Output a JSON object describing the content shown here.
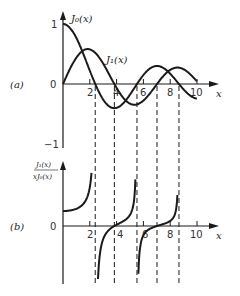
{
  "figure": {
    "panel_a": {
      "label": "(a)",
      "y_ticks": [
        "1",
        "0",
        "−1"
      ],
      "x_ticks": [
        "2",
        "4",
        "6",
        "8",
        "10"
      ],
      "x_axis_label": "x",
      "curve_labels": {
        "j0": "J₀(x)",
        "j1": "J₁(x)"
      }
    },
    "panel_b": {
      "label": "(b)",
      "y_axis_label_num": "J₁(x)",
      "y_axis_label_den": "xJ₀(x)",
      "y_ticks": [
        "0"
      ],
      "x_ticks": [
        "2",
        "4",
        "6",
        "8",
        "10"
      ],
      "x_axis_label": "x"
    },
    "dashed_lines_at_x": [
      2.405,
      3.832,
      5.52,
      7.016,
      8.654
    ],
    "stroke_color": "#1a1a1a"
  },
  "chart_data": [
    {
      "type": "line",
      "title": "(a) Bessel functions J0(x) and J1(x)",
      "xlabel": "x",
      "ylabel": "",
      "xlim": [
        0,
        10.5
      ],
      "ylim": [
        -1,
        1
      ],
      "x_ticks": [
        2,
        4,
        6,
        8,
        10
      ],
      "y_ticks": [
        -1,
        0,
        1
      ],
      "grid": false,
      "series": [
        {
          "name": "J0(x)",
          "x": [
            0,
            1,
            2,
            2.405,
            3,
            3.832,
            4,
            5,
            5.52,
            6,
            7,
            7.016,
            8,
            9,
            10
          ],
          "values": [
            1.0,
            0.765,
            0.224,
            0.0,
            -0.26,
            -0.403,
            -0.397,
            -0.178,
            0.0,
            0.151,
            0.3,
            0.3,
            0.172,
            -0.09,
            -0.246
          ]
        },
        {
          "name": "J1(x)",
          "x": [
            0,
            1,
            1.841,
            2,
            3,
            3.832,
            4,
            5,
            5.331,
            6,
            7,
            7.016,
            8,
            8.536,
            9,
            10
          ],
          "values": [
            0.0,
            0.44,
            0.582,
            0.577,
            0.339,
            0.0,
            -0.066,
            -0.328,
            -0.346,
            -0.277,
            -0.005,
            0.0,
            0.235,
            0.273,
            0.245,
            0.043
          ]
        }
      ],
      "annotations": [
        "Dashed vertical lines at zeros of J0 (2.405, 5.520, 8.654) and zeros of J1 (3.832, 7.016)"
      ]
    },
    {
      "type": "line",
      "title": "(b) J1(x) / (x J0(x))",
      "xlabel": "x",
      "ylabel": "J1(x)/(xJ0(x))",
      "xlim": [
        0,
        10.5
      ],
      "x_ticks": [
        2,
        4,
        6,
        8,
        10
      ],
      "y_ticks": [
        0
      ],
      "grid": false,
      "series": [
        {
          "name": "J1(x)/(xJ0(x))",
          "branches": [
            {
              "x_range": [
                0,
                2.35
              ],
              "behavior": "starts at 0.5, increases to +inf as x->2.405"
            },
            {
              "x_range": [
                2.5,
                5.45
              ],
              "behavior": "-inf to +inf, zero at 3.832"
            },
            {
              "x_range": [
                5.6,
                8.6
              ],
              "behavior": "-inf to +inf, zero at 7.016"
            }
          ]
        }
      ],
      "annotations": [
        "Vertical asymptotes at zeros of J0: 2.405, 5.520, 8.654"
      ]
    }
  ]
}
